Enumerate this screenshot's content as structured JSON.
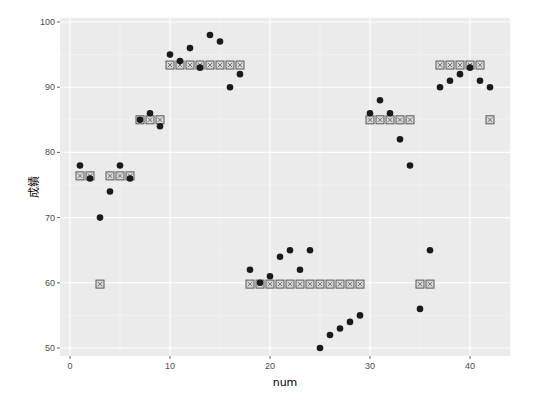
{
  "chart_data": {
    "type": "scatter",
    "title": "",
    "xlabel": "num",
    "ylabel": "成績",
    "xlim": [
      -1,
      44
    ],
    "ylim": [
      48.5,
      100.5
    ],
    "x_ticks": [
      0,
      10,
      20,
      30,
      40
    ],
    "y_ticks": [
      50,
      60,
      70,
      80,
      90,
      100
    ],
    "grid": true,
    "legend": "none",
    "panel_background": "#ebebeb",
    "series": [
      {
        "name": "score",
        "marker": "filled-circle",
        "color": "#1a1a1a",
        "x": [
          1,
          2,
          3,
          4,
          5,
          6,
          7,
          8,
          9,
          10,
          11,
          12,
          13,
          14,
          15,
          16,
          17,
          18,
          19,
          20,
          21,
          22,
          23,
          24,
          25,
          26,
          27,
          28,
          29,
          30,
          31,
          32,
          33,
          34,
          35,
          36,
          37,
          38,
          39,
          40,
          41,
          42
        ],
        "y": [
          78,
          76,
          70,
          74,
          78,
          76,
          85,
          86,
          84,
          95,
          94,
          96,
          93,
          98,
          97,
          90,
          92,
          62,
          60,
          61,
          64,
          65,
          62,
          65,
          50,
          52,
          53,
          54,
          55,
          86,
          88,
          86,
          82,
          78,
          56,
          65,
          90,
          91,
          92,
          93,
          91,
          90
        ]
      },
      {
        "name": "group-mean",
        "marker": "square-with-x",
        "color": "#595959",
        "x": [
          1,
          2,
          3,
          4,
          5,
          6,
          7,
          8,
          9,
          10,
          11,
          12,
          13,
          14,
          15,
          16,
          17,
          18,
          19,
          20,
          21,
          22,
          23,
          24,
          25,
          26,
          27,
          28,
          29,
          30,
          31,
          32,
          33,
          34,
          35,
          36,
          37,
          38,
          39,
          40,
          41,
          42
        ],
        "y": [
          76.4,
          76.4,
          59.8,
          76.4,
          76.4,
          76.4,
          85,
          85,
          85,
          93.4,
          93.4,
          93.4,
          93.4,
          93.4,
          93.4,
          93.4,
          93.4,
          59.8,
          59.8,
          59.8,
          59.8,
          59.8,
          59.8,
          59.8,
          59.8,
          59.8,
          59.8,
          59.8,
          59.8,
          85,
          85,
          85,
          85,
          85,
          59.8,
          59.8,
          93.4,
          93.4,
          93.4,
          93.4,
          93.4,
          85
        ]
      }
    ]
  }
}
